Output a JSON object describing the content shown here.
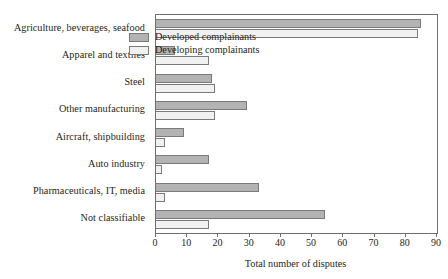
{
  "chart_data": {
    "type": "bar",
    "orientation": "horizontal",
    "title": "",
    "subtitle": "",
    "xlabel": "Total number of disputes",
    "ylabel": "",
    "xlim": [
      0,
      90
    ],
    "xticks": [
      0,
      10,
      20,
      30,
      40,
      50,
      60,
      70,
      80,
      90
    ],
    "xtick_labels": [
      "0",
      "10",
      "20",
      "30",
      "40",
      "50",
      "60",
      "70",
      "80",
      "90"
    ],
    "grid": false,
    "legend_position": "upper right inside",
    "categories": [
      "Agriculture, beverages, seafood",
      "Apparel and textiles",
      "Steel",
      "Other manufacturing",
      "Aircraft, shipbuilding",
      "Auto industry",
      "Pharmaceuticals, IT, media",
      "Not classifiable"
    ],
    "series": [
      {
        "name": "Developed complainants",
        "color": "#b3b3b3",
        "values": [
          85,
          6,
          18,
          29,
          9,
          17,
          33,
          54
        ]
      },
      {
        "name": "Developing complainants",
        "color": "#f1f1f1",
        "values": [
          84,
          17,
          19,
          19,
          3,
          2,
          3,
          17
        ]
      }
    ]
  },
  "legend": {
    "items": [
      {
        "label": "Developed complainants",
        "swatch": "developed"
      },
      {
        "label": "Developing complainants",
        "swatch": "developing"
      }
    ]
  },
  "colors": {
    "developed_fill": "#b3b3b3",
    "developing_fill": "#f1f1f1",
    "bar_stroke": "#7a7a7a",
    "axis": "#6f6f6f",
    "text": "#231f20",
    "background": "#ffffff"
  }
}
